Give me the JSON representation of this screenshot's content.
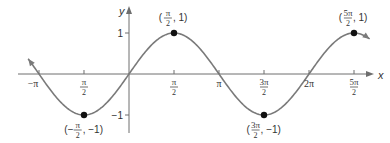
{
  "chart_data": {
    "type": "line",
    "title": "",
    "function": "y = sin(x)",
    "xlabel": "x",
    "ylabel": "y",
    "xlim": [
      -3.53,
      8.4
    ],
    "ylim": [
      -1.4,
      1.6
    ],
    "grid": false,
    "legend": null,
    "x_ticks": [
      {
        "value": -3.14159,
        "label": "−π",
        "num": "",
        "den": ""
      },
      {
        "value": -1.5708,
        "label": "",
        "num": "π",
        "den": "2"
      },
      {
        "value": 1.5708,
        "label": "",
        "num": "π",
        "den": "2"
      },
      {
        "value": 3.14159,
        "label": "π",
        "num": "",
        "den": ""
      },
      {
        "value": 4.7124,
        "label": "",
        "num": "3π",
        "den": "2"
      },
      {
        "value": 6.28319,
        "label": "2π",
        "num": "",
        "den": ""
      },
      {
        "value": 7.854,
        "label": "",
        "num": "5π",
        "den": "2"
      }
    ],
    "y_ticks": [
      {
        "value": 1,
        "label": "1"
      },
      {
        "value": -1,
        "label": "−1"
      }
    ],
    "series": [
      {
        "name": "sin(x)",
        "x_range": [
          -3.52,
          8.4
        ],
        "color": "#7a7a7a"
      }
    ],
    "annotations": [
      {
        "x": -1.5708,
        "y": -1,
        "pre": "(−",
        "num": "π",
        "den": "2",
        "post": ", −1)"
      },
      {
        "x": 1.5708,
        "y": 1,
        "pre": "(",
        "num": "π",
        "den": "2",
        "post": ", 1)"
      },
      {
        "x": 4.7124,
        "y": -1,
        "pre": "(",
        "num": "3π",
        "den": "2",
        "post": ", −1)"
      },
      {
        "x": 7.854,
        "y": 1,
        "pre": "(",
        "num": "5π",
        "den": "2",
        "post": ", 1)"
      }
    ]
  },
  "colors": {
    "curve": "#7a7a7a",
    "axis": "#6e6e6e",
    "point": "#111111",
    "text": "#333333"
  }
}
